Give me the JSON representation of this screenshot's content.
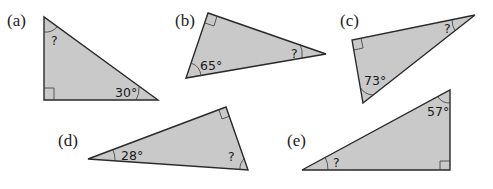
{
  "colors": {
    "fill": "#c9c9c9",
    "stroke": "#2a2a2a",
    "background": "#ffffff"
  },
  "triangles": [
    {
      "label": "(a)",
      "known_angle": "30°",
      "unknown": "?",
      "right_angle": true
    },
    {
      "label": "(b)",
      "known_angle": "65°",
      "unknown": "?",
      "right_angle": true
    },
    {
      "label": "(c)",
      "known_angle": "73°",
      "unknown": "?",
      "right_angle": true
    },
    {
      "label": "(d)",
      "known_angle": "28°",
      "unknown": "?",
      "right_angle": true
    },
    {
      "label": "(e)",
      "known_angle": "57°",
      "unknown": "?",
      "right_angle": true
    }
  ]
}
